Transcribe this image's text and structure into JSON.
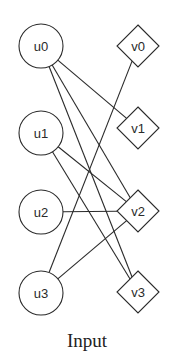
{
  "diagram": {
    "caption": "Input",
    "colors": {
      "stroke": "#2a2a2a",
      "fill": "#ffffff"
    },
    "left_nodes": [
      {
        "id": "u0",
        "label": "u0",
        "shape": "circle",
        "x": 41,
        "y": 46
      },
      {
        "id": "u1",
        "label": "u1",
        "shape": "circle",
        "x": 41,
        "y": 133
      },
      {
        "id": "u2",
        "label": "u2",
        "shape": "circle",
        "x": 41,
        "y": 212
      },
      {
        "id": "u3",
        "label": "u3",
        "shape": "circle",
        "x": 41,
        "y": 293
      }
    ],
    "right_nodes": [
      {
        "id": "v0",
        "label": "v0",
        "shape": "diamond",
        "x": 138,
        "y": 46
      },
      {
        "id": "v1",
        "label": "v1",
        "shape": "diamond",
        "x": 138,
        "y": 128
      },
      {
        "id": "v2",
        "label": "v2",
        "shape": "diamond",
        "x": 138,
        "y": 211
      },
      {
        "id": "v3",
        "label": "v3",
        "shape": "diamond",
        "x": 138,
        "y": 292
      }
    ],
    "edges": [
      [
        "u0",
        "v1"
      ],
      [
        "u0",
        "v2"
      ],
      [
        "u0",
        "v3"
      ],
      [
        "u1",
        "v2"
      ],
      [
        "u1",
        "v3"
      ],
      [
        "u2",
        "v2"
      ],
      [
        "u3",
        "v0"
      ],
      [
        "u3",
        "v2"
      ]
    ]
  }
}
